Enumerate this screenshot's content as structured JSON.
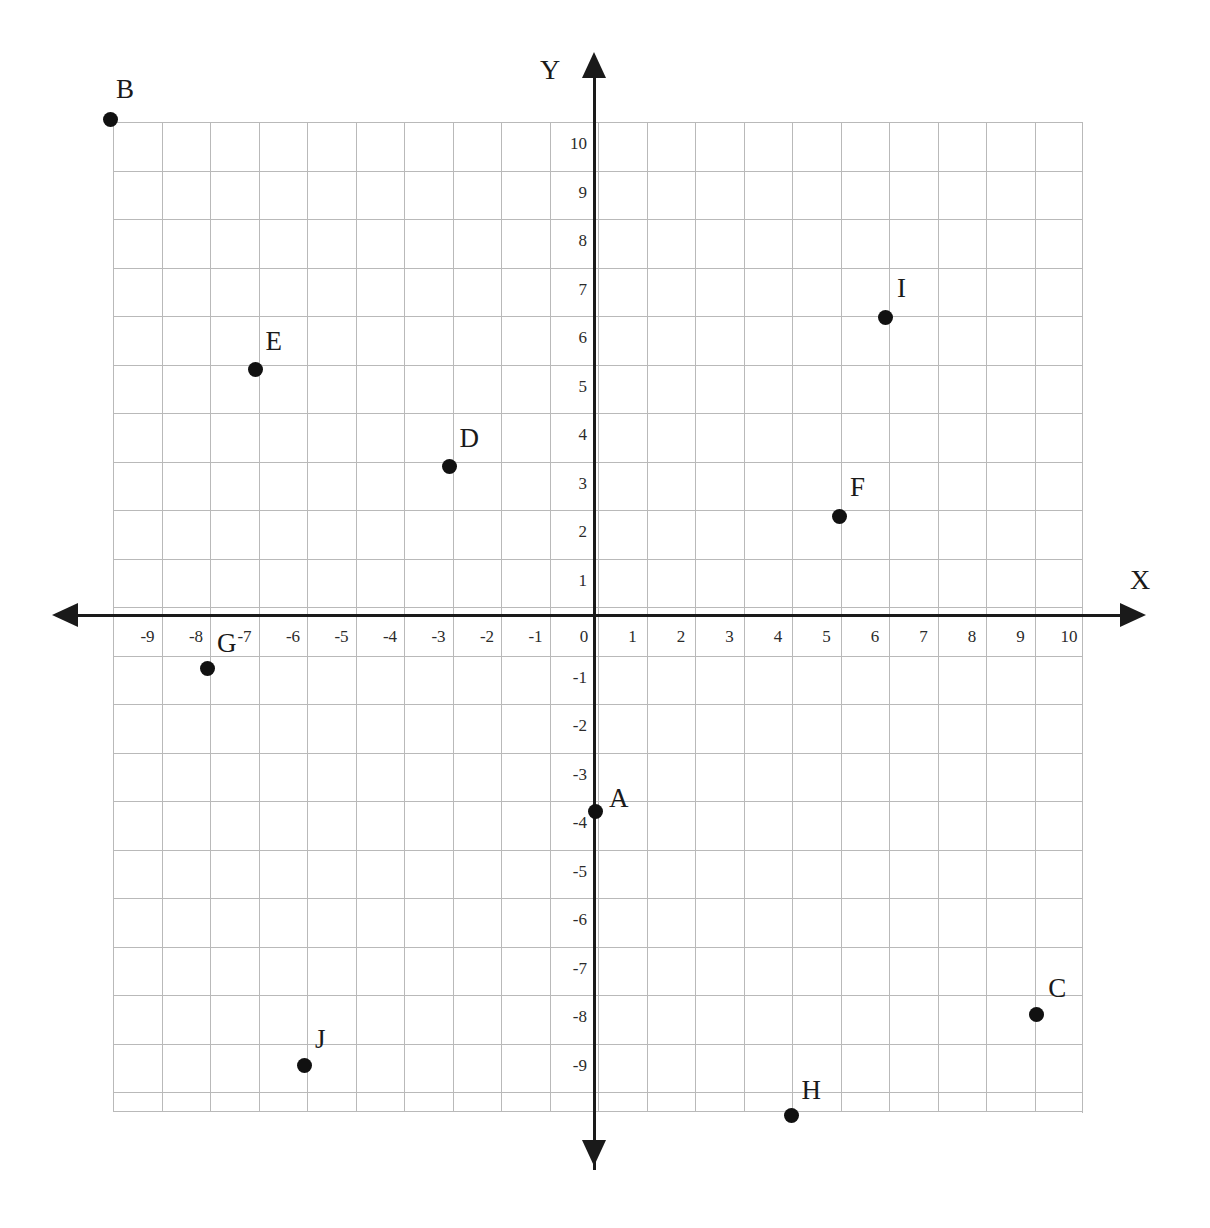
{
  "figure": {
    "kind": "coordinate-plane",
    "background_color": "#ffffff",
    "grid_color": "#b9b9b9",
    "axis_color": "#1a1a1a",
    "point_color": "#111111"
  },
  "axes": {
    "x_name": "X",
    "y_name": "Y",
    "x_ticks": [
      "-9",
      "-8",
      "-7",
      "-6",
      "-5",
      "-4",
      "-3",
      "-2",
      "-1",
      "0",
      "1",
      "2",
      "3",
      "4",
      "5",
      "6",
      "7",
      "8",
      "9",
      "10"
    ],
    "y_ticks": [
      "10",
      "9",
      "8",
      "7",
      "6",
      "5",
      "4",
      "3",
      "2",
      "1",
      "-1",
      "-2",
      "-3",
      "-4",
      "-5",
      "-6",
      "-7",
      "-8",
      "-9"
    ],
    "x_arrow_left": "arrow-left-icon",
    "x_arrow_right": "arrow-right-icon",
    "y_arrow_up": "arrow-up-icon",
    "y_arrow_down": "arrow-down-icon"
  },
  "chart_data": {
    "type": "scatter",
    "title": "",
    "xlabel": "X",
    "ylabel": "Y",
    "xlim": [
      -10,
      10
    ],
    "ylim": [
      -10,
      10
    ],
    "grid": true,
    "legend": "none",
    "x_tick_values": [
      -9,
      -8,
      -7,
      -6,
      -5,
      -4,
      -3,
      -2,
      -1,
      0,
      1,
      2,
      3,
      4,
      5,
      6,
      7,
      8,
      9,
      10
    ],
    "y_tick_values": [
      10,
      9,
      8,
      7,
      6,
      5,
      4,
      3,
      2,
      1,
      -1,
      -2,
      -3,
      -4,
      -5,
      -6,
      -7,
      -8,
      -9
    ],
    "points": [
      {
        "label": "A",
        "x": 0,
        "y": -4,
        "label_dx": 14,
        "label_dy": -26
      },
      {
        "label": "B",
        "x": -10,
        "y": 10.25,
        "label_dx": 6,
        "label_dy": -44
      },
      {
        "label": "C",
        "x": 9.1,
        "y": -8.2,
        "label_dx": 12,
        "label_dy": -40
      },
      {
        "label": "D",
        "x": -3,
        "y": 3.1,
        "label_dx": 10,
        "label_dy": -42
      },
      {
        "label": "E",
        "x": -7,
        "y": 5.1,
        "label_dx": 10,
        "label_dy": -42
      },
      {
        "label": "F",
        "x": 5.05,
        "y": 2.08,
        "label_dx": 10,
        "label_dy": -42
      },
      {
        "label": "G",
        "x": -8,
        "y": -1.06,
        "label_dx": 10,
        "label_dy": -38
      },
      {
        "label": "H",
        "x": 4.05,
        "y": -10.27,
        "label_dx": 10,
        "label_dy": -38
      },
      {
        "label": "I",
        "x": 5.98,
        "y": 6.18,
        "label_dx": 12,
        "label_dy": -42
      },
      {
        "label": "J",
        "x": -5.98,
        "y": -9.25,
        "label_dx": 10,
        "label_dy": -40
      }
    ]
  }
}
